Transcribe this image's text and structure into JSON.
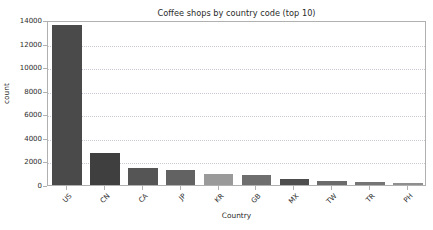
{
  "chart_data": {
    "type": "bar",
    "title": "Coffee shops by country code (top 10)",
    "xlabel": "Country",
    "ylabel": "count",
    "categories": [
      "US",
      "CN",
      "CA",
      "JP",
      "KR",
      "GB",
      "MX",
      "TW",
      "TR",
      "PH"
    ],
    "values": [
      13580,
      2720,
      1480,
      1240,
      960,
      890,
      520,
      320,
      280,
      190
    ],
    "ylim": [
      0,
      14000
    ],
    "yticks": [
      0,
      2000,
      4000,
      6000,
      8000,
      10000,
      12000,
      14000
    ],
    "ytick_labels": [
      "0",
      "2000",
      "4000",
      "6000",
      "8000",
      "10000",
      "12000",
      "14000"
    ],
    "grid": true,
    "grid_axis": "y",
    "grid_style": "dotted",
    "grid_color": "#c9c9d6",
    "legend": null,
    "xtick_rotation": -45,
    "bar_colors": [
      "#4a4a4a",
      "#3f3f3f",
      "#555555",
      "#626262",
      "#9a9a9a",
      "#6e6e6e",
      "#4d4d4d",
      "#6b6b6b",
      "#757575",
      "#8f8f8f"
    ],
    "axes_background": "#ffffff",
    "figure_background": "#ffffff",
    "spine_color": "#b0b0b0"
  }
}
